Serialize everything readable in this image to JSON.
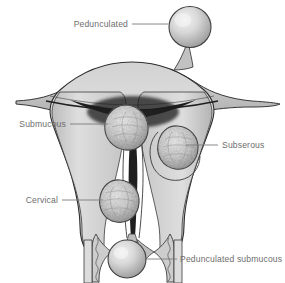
{
  "figure": {
    "background_color": "#ffffff",
    "line_color": "#3a3a3a",
    "label_color": "#6e6e6e",
    "leader_color": "#7a7a7a",
    "tissue_light": "#e3e3e3",
    "tissue_mid": "#c9c9c9",
    "tissue_dark": "#8f8f8f",
    "cavity_color": "#1c1c1c",
    "fibroid_fill": "#cfcfcf",
    "fibroid_rim": "#6a6a6a",
    "pedunculated_fill": "#d9d9d9"
  },
  "labels": [
    {
      "id": "pedunculated",
      "text": "Pedunculated",
      "text_anchor": "end",
      "text_x": 128,
      "text_y": 27,
      "leader": "M132,24 L168,24",
      "target": "pedunculated-fibroid"
    },
    {
      "id": "submucous",
      "text": "Submucous",
      "text_anchor": "end",
      "text_x": 66,
      "text_y": 127,
      "leader": "M70,124 L108,124",
      "target": "submucous-fibroid"
    },
    {
      "id": "subserous",
      "text": "Subserous",
      "text_anchor": "start",
      "text_x": 222,
      "text_y": 148,
      "leader": "M186,145 L218,145",
      "target": "subserous-fibroid"
    },
    {
      "id": "cervical",
      "text": "Cervical",
      "text_anchor": "end",
      "text_x": 58,
      "text_y": 203,
      "leader": "M62,200 L103,200",
      "target": "cervical-fibroid"
    },
    {
      "id": "pedunculated-submucous",
      "text": "Pedunculated submucous",
      "text_anchor": "start",
      "text_x": 180,
      "text_y": 262,
      "leader": "M146,259 L177,259",
      "target": "pedunculated-submucous-fibroid"
    }
  ],
  "anatomy": [
    {
      "id": "uterine-body",
      "name": "uterine body and wall"
    },
    {
      "id": "fundus",
      "name": "uterine fundus"
    },
    {
      "id": "fallopian-tube-left",
      "name": "left fallopian tube / broad ligament"
    },
    {
      "id": "fallopian-tube-right",
      "name": "right fallopian tube / broad ligament"
    },
    {
      "id": "endometrial-cavity",
      "name": "endometrial cavity"
    },
    {
      "id": "cervical-canal",
      "name": "cervical canal"
    },
    {
      "id": "cervix",
      "name": "cervix"
    },
    {
      "id": "vaginal-wall-left",
      "name": "left vaginal wall with rugae"
    },
    {
      "id": "vaginal-wall-right",
      "name": "right vaginal wall with rugae"
    }
  ],
  "fibroids": [
    {
      "id": "pedunculated-fibroid",
      "type": "Pedunculated",
      "cx": 190,
      "cy": 27,
      "r": 21
    },
    {
      "id": "submucous-fibroid",
      "type": "Submucous",
      "cx": 125,
      "cy": 127,
      "r": 22
    },
    {
      "id": "subserous-fibroid",
      "type": "Subserous",
      "cx": 177,
      "cy": 148,
      "r": 21
    },
    {
      "id": "cervical-fibroid",
      "type": "Cervical",
      "cx": 120,
      "cy": 201,
      "r": 21
    },
    {
      "id": "pedunculated-submucous-fibroid",
      "type": "Pedunculated submucous",
      "cx": 127,
      "cy": 259,
      "r": 19
    }
  ]
}
